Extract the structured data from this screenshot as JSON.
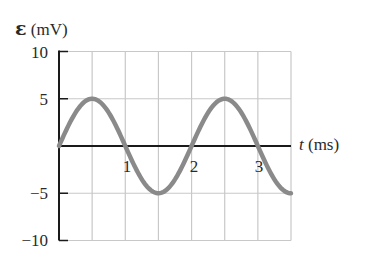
{
  "chart_data": {
    "type": "line",
    "title": "",
    "ylabel_symbol": "ε",
    "ylabel_unit": "(mV)",
    "xlabel_symbol": "t",
    "xlabel_unit": "(ms)",
    "xlim": [
      0,
      3.5
    ],
    "ylim": [
      -10,
      10
    ],
    "grid": true,
    "x_gridlines": [
      0.5,
      1,
      1.5,
      2,
      2.5,
      3,
      3.5
    ],
    "y_gridlines": [
      -10,
      -5,
      5,
      10
    ],
    "x_ticks": [
      {
        "value": 1,
        "label": "1"
      },
      {
        "value": 2,
        "label": "2"
      },
      {
        "value": 3,
        "label": "3"
      }
    ],
    "y_ticks": [
      {
        "value": 10,
        "label": "10"
      },
      {
        "value": 5,
        "label": "5"
      },
      {
        "value": -5,
        "label": "−5"
      },
      {
        "value": -10,
        "label": "−10"
      }
    ],
    "series": [
      {
        "name": "emf",
        "function": "5*sin(pi*t)",
        "amplitude_mV": 5,
        "period_ms": 2,
        "x": [
          0,
          0.25,
          0.5,
          0.75,
          1,
          1.25,
          1.5,
          1.75,
          2,
          2.25,
          2.5,
          2.75,
          3,
          3.25,
          3.5
        ],
        "values": [
          0,
          3.54,
          5,
          3.54,
          0,
          -3.54,
          -5,
          -3.54,
          0,
          3.54,
          5,
          3.54,
          0,
          -3.54,
          -5
        ],
        "color": "#8a8a8a"
      }
    ],
    "legend": "none"
  },
  "colors": {
    "grid": "#c8c8c8",
    "axis": "#1a1a1a",
    "curve": "#8a8a8a"
  }
}
